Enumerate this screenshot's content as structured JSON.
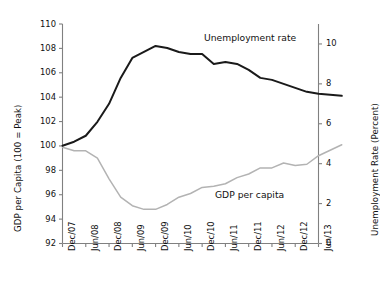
{
  "chart_data": {
    "type": "line",
    "title": "",
    "subtitle": "",
    "xlabel": "",
    "ylabel": "GDP per Capita (100 = Peak)",
    "ylabel_right": "Unemployment Rate (Percent)",
    "grid": false,
    "legend_position": "inline-annotation",
    "x": [
      "Dec/07",
      "Jun/08",
      "Dec/08",
      "Jun/09",
      "Dec/09",
      "Jun/10",
      "Dec/10",
      "Jun/11",
      "Dec/11",
      "Jun/12",
      "Dec/12",
      "Jun/13"
    ],
    "xtick_labels": [
      "Dec/07",
      "Jun/08",
      "Dec/08",
      "Jun/09",
      "Dec/09",
      "Jun/10",
      "Dec/10",
      "Jun/11",
      "Dec/11",
      "Jun/12",
      "Dec/12",
      "Jun/13"
    ],
    "ylim": [
      92,
      110
    ],
    "ytick_labels": [
      "92",
      "94",
      "96",
      "98",
      "100",
      "102",
      "104",
      "106",
      "108",
      "110"
    ],
    "yticks": [
      92,
      94,
      96,
      98,
      100,
      102,
      104,
      106,
      108,
      110
    ],
    "ylim_right": [
      0,
      11
    ],
    "ytick_labels_right": [
      "0",
      "2",
      "4",
      "6",
      "8",
      "10"
    ],
    "yticks_right": [
      0,
      2,
      4,
      6,
      8,
      10
    ],
    "series": [
      {
        "name": "Unemployment rate",
        "axis": "right",
        "color": "#1a1a1a",
        "annotation": "Unemployment rate",
        "units": "percent",
        "x": [
          "Dec/07",
          "Mar/08",
          "Jun/08",
          "Sep/08",
          "Dec/08",
          "Mar/09",
          "Jun/09",
          "Sep/09",
          "Dec/09",
          "Mar/10",
          "Jun/10",
          "Sep/10",
          "Dec/10",
          "Mar/11",
          "Jun/11",
          "Sep/11",
          "Dec/11",
          "Mar/12",
          "Jun/12",
          "Sep/12",
          "Dec/12",
          "Mar/13",
          "Jun/13",
          "Dec/13"
        ],
        "values": [
          4.9,
          5.1,
          5.4,
          6.1,
          7.0,
          8.3,
          9.3,
          9.6,
          9.9,
          9.8,
          9.6,
          9.5,
          9.5,
          9.0,
          9.1,
          9.0,
          8.7,
          8.3,
          8.2,
          8.0,
          7.8,
          7.6,
          7.5,
          7.4
        ],
        "peak_value": 9.9,
        "peak_x": "Dec/09",
        "end_value": 7.4
      },
      {
        "name": "GDP per capita",
        "axis": "left",
        "color": "#b3b3b3",
        "annotation": "GDP per capita",
        "units": "index, 100 = peak",
        "x": [
          "Dec/07",
          "Mar/08",
          "Jun/08",
          "Sep/08",
          "Dec/08",
          "Mar/09",
          "Jun/09",
          "Sep/09",
          "Dec/09",
          "Mar/10",
          "Jun/10",
          "Sep/10",
          "Dec/10",
          "Mar/11",
          "Jun/11",
          "Sep/11",
          "Dec/11",
          "Mar/12",
          "Jun/12",
          "Sep/12",
          "Dec/12",
          "Mar/13",
          "Jun/13",
          "Dec/13"
        ],
        "values": [
          99.9,
          99.6,
          99.6,
          99.0,
          97.3,
          95.8,
          95.1,
          94.8,
          94.8,
          95.2,
          95.8,
          96.1,
          96.6,
          96.7,
          96.9,
          97.4,
          97.7,
          98.2,
          98.2,
          98.6,
          98.4,
          98.5,
          99.2,
          100.1
        ],
        "trough_value": 94.8,
        "trough_x": "Sep/09",
        "end_value": 100.1
      }
    ]
  },
  "annotations": {
    "unemployment": "Unemployment rate",
    "gdp": "GDP per capita"
  }
}
